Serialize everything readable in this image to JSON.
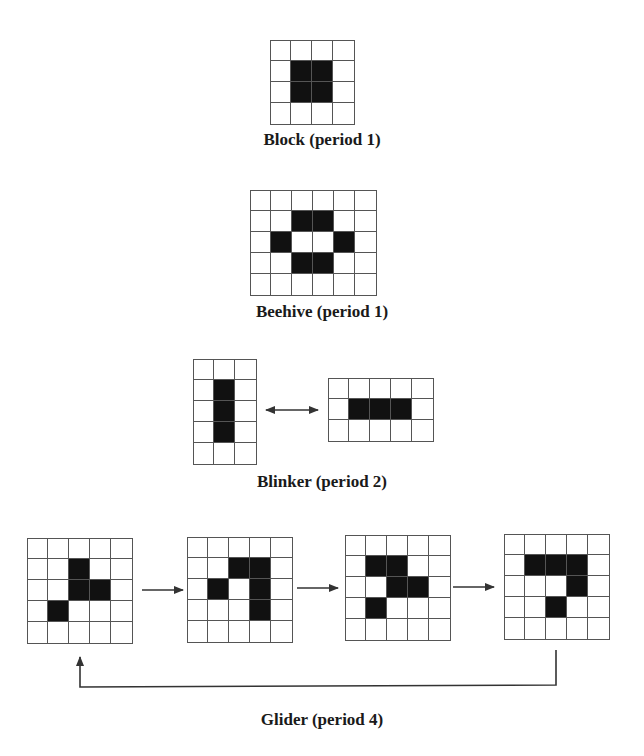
{
  "figure": {
    "cell_size": 21,
    "colors": {
      "live": "#111111",
      "dead": "#ffffff",
      "grid_line": "#555555",
      "arrow": "#333333"
    },
    "patterns": [
      {
        "id": "block",
        "caption": "Block (period 1)",
        "caption_y": 130,
        "frames": [
          {
            "x": 270,
            "y": 40,
            "cols": 4,
            "rows": 4,
            "live": [
              [
                1,
                1
              ],
              [
                1,
                2
              ],
              [
                2,
                1
              ],
              [
                2,
                2
              ]
            ]
          }
        ]
      },
      {
        "id": "beehive",
        "caption": "Beehive (period 1)",
        "caption_y": 302,
        "frames": [
          {
            "x": 250,
            "y": 190,
            "cols": 6,
            "rows": 5,
            "live": [
              [
                1,
                2
              ],
              [
                1,
                3
              ],
              [
                2,
                1
              ],
              [
                2,
                4
              ],
              [
                3,
                2
              ],
              [
                3,
                3
              ]
            ]
          }
        ]
      },
      {
        "id": "blinker",
        "caption": "Blinker (period 2)",
        "caption_y": 472,
        "frames": [
          {
            "x": 193,
            "y": 359,
            "cols": 3,
            "rows": 5,
            "live": [
              [
                1,
                1
              ],
              [
                2,
                1
              ],
              [
                3,
                1
              ]
            ]
          },
          {
            "x": 328,
            "y": 378,
            "cols": 5,
            "rows": 3,
            "live": [
              [
                1,
                1
              ],
              [
                1,
                2
              ],
              [
                1,
                3
              ]
            ]
          }
        ]
      },
      {
        "id": "glider",
        "caption": "Glider (period 4)",
        "caption_y": 710,
        "frames": [
          {
            "x": 27,
            "y": 538,
            "cols": 5,
            "rows": 5,
            "live": [
              [
                1,
                2
              ],
              [
                2,
                2
              ],
              [
                2,
                3
              ],
              [
                3,
                1
              ]
            ]
          },
          {
            "x": 187,
            "y": 537,
            "cols": 5,
            "rows": 5,
            "live": [
              [
                1,
                2
              ],
              [
                1,
                3
              ],
              [
                2,
                1
              ],
              [
                2,
                3
              ],
              [
                3,
                3
              ]
            ]
          },
          {
            "x": 345,
            "y": 535,
            "cols": 5,
            "rows": 5,
            "live": [
              [
                1,
                1
              ],
              [
                1,
                2
              ],
              [
                2,
                2
              ],
              [
                2,
                3
              ],
              [
                3,
                1
              ]
            ]
          },
          {
            "x": 504,
            "y": 534,
            "cols": 5,
            "rows": 5,
            "live": [
              [
                1,
                1
              ],
              [
                1,
                2
              ],
              [
                1,
                3
              ],
              [
                2,
                3
              ],
              [
                3,
                2
              ]
            ]
          }
        ]
      }
    ],
    "arrows": [
      {
        "type": "double",
        "from": [
          266,
          410
        ],
        "to": [
          318,
          410
        ]
      },
      {
        "type": "single",
        "from": [
          142,
          590
        ],
        "to": [
          183,
          590
        ]
      },
      {
        "type": "single",
        "from": [
          297,
          588
        ],
        "to": [
          338,
          588
        ]
      },
      {
        "type": "single",
        "from": [
          453,
          587
        ],
        "to": [
          494,
          587
        ]
      },
      {
        "type": "loop",
        "points": [
          [
            556,
            650
          ],
          [
            556,
            685
          ],
          [
            80,
            687
          ],
          [
            80,
            657
          ]
        ]
      }
    ]
  }
}
